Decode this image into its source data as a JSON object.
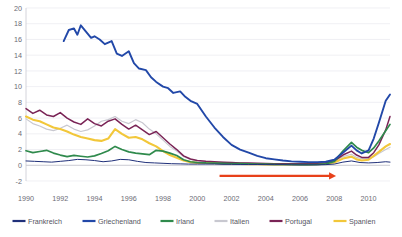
{
  "chart_data": {
    "type": "line",
    "title": "",
    "subtitle": "",
    "xlabel": "",
    "ylabel": "",
    "xlim": [
      1990,
      2011.25
    ],
    "ylim": [
      -2,
      20
    ],
    "ytick_step": 2,
    "grid": true,
    "legend_position": "bottom",
    "xticks": [
      "1990",
      "1992",
      "1994",
      "1996",
      "1998",
      "2000",
      "2002",
      "2004",
      "2006",
      "2008",
      "2010"
    ],
    "xtick_values": [
      1990,
      1992,
      1994,
      1996,
      1998,
      2000,
      2002,
      2004,
      2006,
      2008,
      2010
    ],
    "yticks": [
      "20",
      "18",
      "16",
      "14",
      "12",
      "10",
      "8",
      "6",
      "4",
      "2",
      "0",
      "-2"
    ],
    "ytick_values": [
      20,
      18,
      16,
      14,
      12,
      10,
      8,
      6,
      4,
      2,
      0,
      -2
    ],
    "annotations": [
      {
        "name": "convergence-arrow",
        "type": "arrow",
        "color": "#e8411a",
        "x_start": 2001.3,
        "x_end": 2008.1,
        "y": -1.35,
        "label": ""
      }
    ],
    "series": [
      {
        "name": "Frankreich",
        "color": "#20307a",
        "width": 1.0,
        "x": [
          1990.0,
          1990.5,
          1991.0,
          1991.5,
          1992.0,
          1992.5,
          1993.0,
          1993.5,
          1994.0,
          1994.5,
          1995.0,
          1995.5,
          1996.0,
          1996.5,
          1997.0,
          1997.5,
          1998.0,
          1998.5,
          1999.0,
          1999.5,
          2000.0,
          2000.5,
          2001.0,
          2001.5,
          2002.0,
          2002.5,
          2003.0,
          2003.5,
          2004.0,
          2004.5,
          2005.0,
          2005.5,
          2006.0,
          2006.5,
          2007.0,
          2007.5,
          2008.0,
          2008.5,
          2009.0,
          2009.5,
          2010.0,
          2010.5,
          2011.0,
          2011.25
        ],
        "y": [
          0.55,
          0.5,
          0.45,
          0.4,
          0.5,
          0.6,
          0.75,
          0.7,
          0.6,
          0.45,
          0.55,
          0.75,
          0.7,
          0.5,
          0.35,
          0.3,
          0.25,
          0.2,
          0.18,
          0.15,
          0.15,
          0.15,
          0.15,
          0.12,
          0.12,
          0.1,
          0.1,
          0.1,
          0.08,
          0.08,
          0.08,
          0.05,
          0.05,
          0.05,
          0.05,
          0.08,
          0.15,
          0.4,
          0.55,
          0.35,
          0.3,
          0.35,
          0.45,
          0.4
        ]
      },
      {
        "name": "Griechenland",
        "color": "#2248a8",
        "width": 1.9,
        "x": [
          1992.2,
          1992.5,
          1992.8,
          1993.0,
          1993.2,
          1993.5,
          1993.8,
          1994.0,
          1994.3,
          1994.6,
          1995.0,
          1995.3,
          1995.6,
          1996.0,
          1996.3,
          1996.6,
          1997.0,
          1997.3,
          1997.6,
          1998.0,
          1998.3,
          1998.6,
          1999.0,
          1999.3,
          1999.6,
          2000.0,
          2000.5,
          2001.0,
          2001.5,
          2002.0,
          2002.5,
          2003.0,
          2003.5,
          2004.0,
          2004.5,
          2005.0,
          2005.5,
          2006.0,
          2006.5,
          2007.0,
          2007.5,
          2008.0,
          2008.5,
          2009.0,
          2009.3,
          2009.6,
          2010.0,
          2010.3,
          2010.6,
          2011.0,
          2011.25
        ],
        "y": [
          15.8,
          17.2,
          17.4,
          16.6,
          17.8,
          17.0,
          16.2,
          16.4,
          16.0,
          15.4,
          15.8,
          14.2,
          13.9,
          14.5,
          13.0,
          12.3,
          12.1,
          11.2,
          10.6,
          10.0,
          9.8,
          9.2,
          9.4,
          8.7,
          8.2,
          7.8,
          6.2,
          4.8,
          3.6,
          2.6,
          2.0,
          1.6,
          1.2,
          0.9,
          0.75,
          0.6,
          0.5,
          0.45,
          0.4,
          0.4,
          0.45,
          0.7,
          1.6,
          2.5,
          1.9,
          1.5,
          1.9,
          3.4,
          5.4,
          8.2,
          9.0
        ]
      },
      {
        "name": "Irland",
        "color": "#2f8a4c",
        "width": 1.7,
        "x": [
          1990.0,
          1990.4,
          1990.8,
          1991.2,
          1991.6,
          1992.0,
          1992.4,
          1992.8,
          1993.2,
          1993.6,
          1994.0,
          1994.4,
          1994.8,
          1995.2,
          1995.6,
          1996.0,
          1996.4,
          1996.8,
          1997.2,
          1997.6,
          1998.0,
          1998.4,
          1998.8,
          1999.2,
          1999.6,
          2000.0,
          2000.5,
          2001.0,
          2001.5,
          2002.0,
          2002.5,
          2003.0,
          2003.5,
          2004.0,
          2004.5,
          2005.0,
          2005.5,
          2006.0,
          2006.5,
          2007.0,
          2007.5,
          2008.0,
          2008.5,
          2009.0,
          2009.3,
          2009.6,
          2010.0,
          2010.3,
          2010.6,
          2011.0,
          2011.25
        ],
        "y": [
          1.85,
          1.6,
          1.75,
          1.9,
          1.55,
          1.3,
          1.1,
          1.25,
          1.15,
          1.05,
          1.2,
          1.5,
          1.85,
          2.4,
          2.0,
          1.7,
          1.55,
          1.45,
          1.35,
          1.9,
          1.8,
          1.55,
          1.25,
          0.7,
          0.45,
          0.35,
          0.3,
          0.28,
          0.25,
          0.22,
          0.2,
          0.18,
          0.15,
          0.15,
          0.12,
          0.1,
          0.1,
          0.08,
          0.08,
          0.1,
          0.18,
          0.5,
          1.8,
          2.9,
          2.3,
          1.9,
          1.6,
          2.2,
          3.1,
          4.4,
          5.2
        ]
      },
      {
        "name": "Italien",
        "color": "#c8c8d0",
        "width": 1.2,
        "x": [
          1990.0,
          1990.4,
          1990.8,
          1991.2,
          1991.6,
          1992.0,
          1992.4,
          1992.8,
          1993.2,
          1993.6,
          1994.0,
          1994.4,
          1994.8,
          1995.2,
          1995.6,
          1996.0,
          1996.4,
          1996.8,
          1997.2,
          1997.6,
          1998.0,
          1998.4,
          1998.8,
          1999.2,
          1999.6,
          2000.0,
          2000.5,
          2001.0,
          2001.5,
          2002.0,
          2002.5,
          2003.0,
          2003.5,
          2004.0,
          2004.5,
          2005.0,
          2005.5,
          2006.0,
          2006.5,
          2007.0,
          2007.5,
          2008.0,
          2008.5,
          2009.0,
          2009.3,
          2009.6,
          2010.0,
          2010.3,
          2010.6,
          2011.0,
          2011.25
        ],
        "y": [
          5.9,
          5.3,
          5.0,
          4.6,
          4.4,
          4.7,
          5.1,
          4.6,
          4.3,
          4.5,
          5.0,
          5.6,
          5.8,
          6.2,
          5.6,
          5.3,
          5.8,
          5.4,
          4.6,
          4.0,
          3.2,
          2.4,
          1.8,
          1.1,
          0.75,
          0.55,
          0.45,
          0.4,
          0.38,
          0.32,
          0.3,
          0.25,
          0.22,
          0.2,
          0.18,
          0.18,
          0.2,
          0.22,
          0.22,
          0.25,
          0.3,
          0.5,
          1.1,
          1.4,
          1.0,
          0.85,
          0.85,
          1.1,
          1.5,
          2.0,
          2.3
        ]
      },
      {
        "name": "Portugal",
        "color": "#7a2456",
        "width": 1.5,
        "x": [
          1990.0,
          1990.4,
          1990.8,
          1991.2,
          1991.6,
          1992.0,
          1992.4,
          1992.8,
          1993.2,
          1993.6,
          1994.0,
          1994.4,
          1994.8,
          1995.2,
          1995.6,
          1996.0,
          1996.4,
          1996.8,
          1997.2,
          1997.6,
          1998.0,
          1998.4,
          1998.8,
          1999.2,
          1999.6,
          2000.0,
          2000.5,
          2001.0,
          2001.5,
          2002.0,
          2002.5,
          2003.0,
          2003.5,
          2004.0,
          2004.5,
          2005.0,
          2005.5,
          2006.0,
          2006.5,
          2007.0,
          2007.5,
          2008.0,
          2008.5,
          2009.0,
          2009.3,
          2009.6,
          2010.0,
          2010.3,
          2010.6,
          2011.0,
          2011.25
        ],
        "y": [
          7.2,
          6.6,
          7.0,
          6.4,
          6.2,
          6.7,
          6.0,
          5.5,
          5.2,
          5.9,
          5.3,
          5.0,
          5.6,
          5.9,
          5.2,
          4.6,
          5.1,
          4.5,
          3.9,
          4.3,
          3.5,
          2.7,
          2.0,
          1.2,
          0.8,
          0.6,
          0.5,
          0.45,
          0.4,
          0.35,
          0.3,
          0.28,
          0.25,
          0.22,
          0.2,
          0.2,
          0.2,
          0.2,
          0.22,
          0.25,
          0.32,
          0.55,
          1.3,
          1.8,
          1.3,
          1.0,
          1.0,
          1.6,
          2.6,
          4.5,
          6.2
        ]
      },
      {
        "name": "Spanien",
        "color": "#f2c73a",
        "width": 2.1,
        "x": [
          1990.0,
          1990.4,
          1990.8,
          1991.2,
          1991.6,
          1992.0,
          1992.4,
          1992.8,
          1993.2,
          1993.6,
          1994.0,
          1994.4,
          1994.8,
          1995.2,
          1995.6,
          1996.0,
          1996.4,
          1996.8,
          1997.2,
          1997.6,
          1998.0,
          1998.4,
          1998.8,
          1999.2,
          1999.6,
          2000.0,
          2000.5,
          2001.0,
          2001.5,
          2002.0,
          2002.5,
          2003.0,
          2003.5,
          2004.0,
          2004.5,
          2005.0,
          2005.5,
          2006.0,
          2006.5,
          2007.0,
          2007.5,
          2008.0,
          2008.5,
          2009.0,
          2009.3,
          2009.6,
          2010.0,
          2010.3,
          2010.6,
          2011.0,
          2011.25
        ],
        "y": [
          6.2,
          5.8,
          5.6,
          5.2,
          4.8,
          4.6,
          4.3,
          3.9,
          3.6,
          3.4,
          3.2,
          3.1,
          3.4,
          4.6,
          4.0,
          3.5,
          3.6,
          3.3,
          2.8,
          2.4,
          1.8,
          1.3,
          0.95,
          0.6,
          0.4,
          0.3,
          0.28,
          0.25,
          0.22,
          0.2,
          0.18,
          0.15,
          0.15,
          0.12,
          0.1,
          0.1,
          0.1,
          0.1,
          0.12,
          0.15,
          0.2,
          0.35,
          0.85,
          1.1,
          0.75,
          0.6,
          0.7,
          1.2,
          1.7,
          2.4,
          2.7
        ]
      }
    ]
  },
  "legend": {
    "items": [
      {
        "label": "Frankreich",
        "color": "#20307a"
      },
      {
        "label": "Griechenland",
        "color": "#2248a8"
      },
      {
        "label": "Irland",
        "color": "#2f8a4c"
      },
      {
        "label": "Italien",
        "color": "#c8c8d0"
      },
      {
        "label": "Portugal",
        "color": "#7a2456"
      },
      {
        "label": "Spanien",
        "color": "#f2c73a"
      }
    ]
  }
}
